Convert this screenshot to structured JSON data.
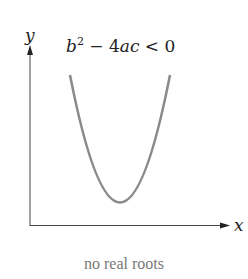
{
  "diagram": {
    "y_axis_label": "y",
    "x_axis_label": "x",
    "condition": {
      "b": "b",
      "exp": "2",
      "rest": " − 4",
      "ac": "ac",
      "tail": " < 0"
    },
    "caption": "no real roots",
    "curve_color": "#8a8a8a",
    "axis_color": "#444444"
  }
}
